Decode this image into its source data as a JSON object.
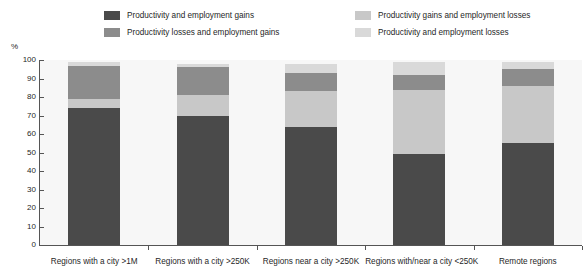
{
  "chart_data": {
    "type": "bar",
    "subtype": "stacked-bar-100",
    "title": "",
    "xlabel": "",
    "ylabel": "%",
    "ylim": [
      0,
      100
    ],
    "yticks": [
      0,
      10,
      20,
      30,
      40,
      50,
      60,
      70,
      80,
      90,
      100
    ],
    "ytick_labels": [
      "0",
      "10",
      "20",
      "30",
      "40",
      "50",
      "60",
      "70",
      "80",
      "90",
      "100"
    ],
    "grid": false,
    "legend_position": "top",
    "categories": [
      "Regions with a city >1M",
      "Regions with a city >250K",
      "Regions near a city >250K",
      "Regions with/near a city <250K",
      "Remote regions"
    ],
    "series": [
      {
        "name": "Productivity and employment gains",
        "color": "#4a4a4a",
        "values": [
          74,
          70,
          64,
          49,
          55
        ]
      },
      {
        "name": "Productivity gains and employment losses",
        "color": "#c8c8c8",
        "values": [
          5,
          11,
          19,
          35,
          31
        ]
      },
      {
        "name": "Productivity losses and employment gains",
        "color": "#8c8c8c",
        "values": [
          18,
          15,
          10,
          8,
          9
        ]
      },
      {
        "name": "Productivity and employment losses",
        "color": "#d9d9d9",
        "values": [
          2,
          2,
          5,
          7,
          4
        ]
      }
    ]
  },
  "legend": {
    "left_column": [
      {
        "label": "Productivity and employment gains",
        "color": "#4a4a4a",
        "swatch": "legend-swatch-dark"
      },
      {
        "label": "Productivity losses and employment gains",
        "color": "#8c8c8c",
        "swatch": "legend-swatch-medium"
      }
    ],
    "right_column": [
      {
        "label": "Productivity gains and employment losses",
        "color": "#c8c8c8",
        "swatch": "legend-swatch-light"
      },
      {
        "label": "Productivity and employment losses",
        "color": "#d9d9d9",
        "swatch": "legend-swatch-lightest"
      }
    ]
  },
  "axis": {
    "unit_label": "%"
  }
}
